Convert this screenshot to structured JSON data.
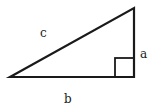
{
  "diagram": {
    "type": "right-triangle",
    "labels": {
      "hypotenuse": "c",
      "vertical_leg": "a",
      "horizontal_leg": "b"
    },
    "vertices": {
      "left": [
        10,
        77
      ],
      "top_right": [
        134,
        8
      ],
      "bottom_right": [
        134,
        77
      ]
    },
    "right_angle_marker": {
      "x": 115,
      "y": 58,
      "size": 19
    },
    "stroke_color": "#1a1a1a",
    "background": "#ffffff"
  }
}
